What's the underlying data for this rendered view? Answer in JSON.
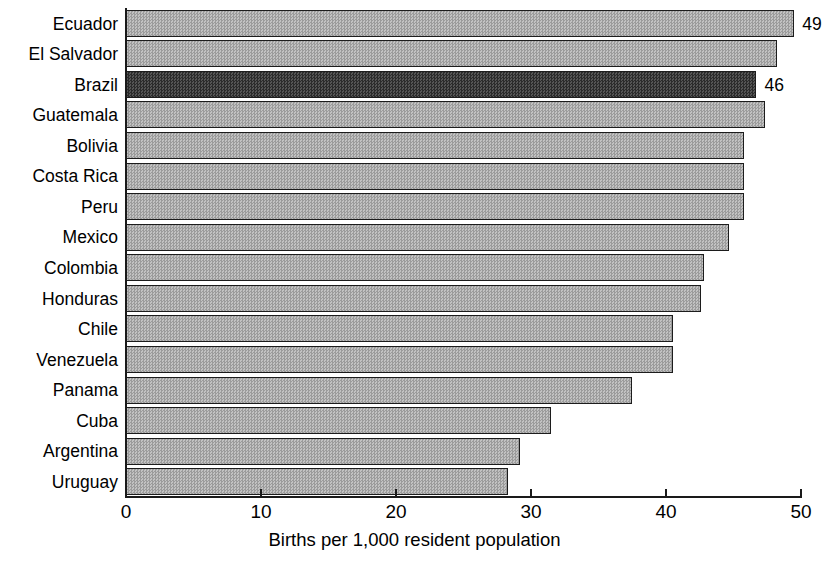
{
  "chart_data": {
    "type": "bar",
    "orientation": "horizontal",
    "title": "",
    "xlabel": "Births per 1,000 resident population",
    "ylabel": "",
    "xlim": [
      0,
      50
    ],
    "xticks": [
      0,
      10,
      20,
      30,
      40,
      50
    ],
    "xtick_labels": [
      "0",
      "10",
      "20",
      "30",
      "40",
      "50"
    ],
    "grid": false,
    "legend": null,
    "categories": [
      "Ecuador",
      "El Salvador",
      "Brazil",
      "Guatemala",
      "Bolivia",
      "Costa Rica",
      "Peru",
      "Mexico",
      "Colombia",
      "Honduras",
      "Chile",
      "Venezuela",
      "Panama",
      "Cuba",
      "Argentina",
      "Uruguay"
    ],
    "values": [
      49.5,
      48.2,
      46.7,
      47.3,
      45.8,
      45.8,
      45.8,
      44.7,
      42.8,
      42.6,
      40.5,
      40.5,
      37.5,
      31.5,
      29.2,
      28.3
    ],
    "bars": [
      {
        "category": "Ecuador",
        "value": 49.5,
        "label": "49",
        "highlight": false
      },
      {
        "category": "El Salvador",
        "value": 48.2,
        "label": "",
        "highlight": false
      },
      {
        "category": "Brazil",
        "value": 46.7,
        "label": "46",
        "highlight": true
      },
      {
        "category": "Guatemala",
        "value": 47.3,
        "label": "",
        "highlight": false
      },
      {
        "category": "Bolivia",
        "value": 45.8,
        "label": "",
        "highlight": false
      },
      {
        "category": "Costa Rica",
        "value": 45.8,
        "label": "",
        "highlight": false
      },
      {
        "category": "Peru",
        "value": 45.8,
        "label": "",
        "highlight": false
      },
      {
        "category": "Mexico",
        "value": 44.7,
        "label": "",
        "highlight": false
      },
      {
        "category": "Colombia",
        "value": 42.8,
        "label": "",
        "highlight": false
      },
      {
        "category": "Honduras",
        "value": 42.6,
        "label": "",
        "highlight": false
      },
      {
        "category": "Chile",
        "value": 40.5,
        "label": "",
        "highlight": false
      },
      {
        "category": "Venezuela",
        "value": 40.5,
        "label": "",
        "highlight": false
      },
      {
        "category": "Panama",
        "value": 37.5,
        "label": "",
        "highlight": false
      },
      {
        "category": "Cuba",
        "value": 31.5,
        "label": "",
        "highlight": false
      },
      {
        "category": "Argentina",
        "value": 29.2,
        "label": "",
        "highlight": false
      },
      {
        "category": "Uruguay",
        "value": 28.3,
        "label": "",
        "highlight": false
      }
    ],
    "colors": {
      "bar_fill": "#ababab",
      "bar_highlight_fill": "#3b3b3b",
      "bar_outline": "#1c1c1c",
      "axis": "#1a1a1a",
      "text": "#000000",
      "background": "#ffffff"
    }
  }
}
